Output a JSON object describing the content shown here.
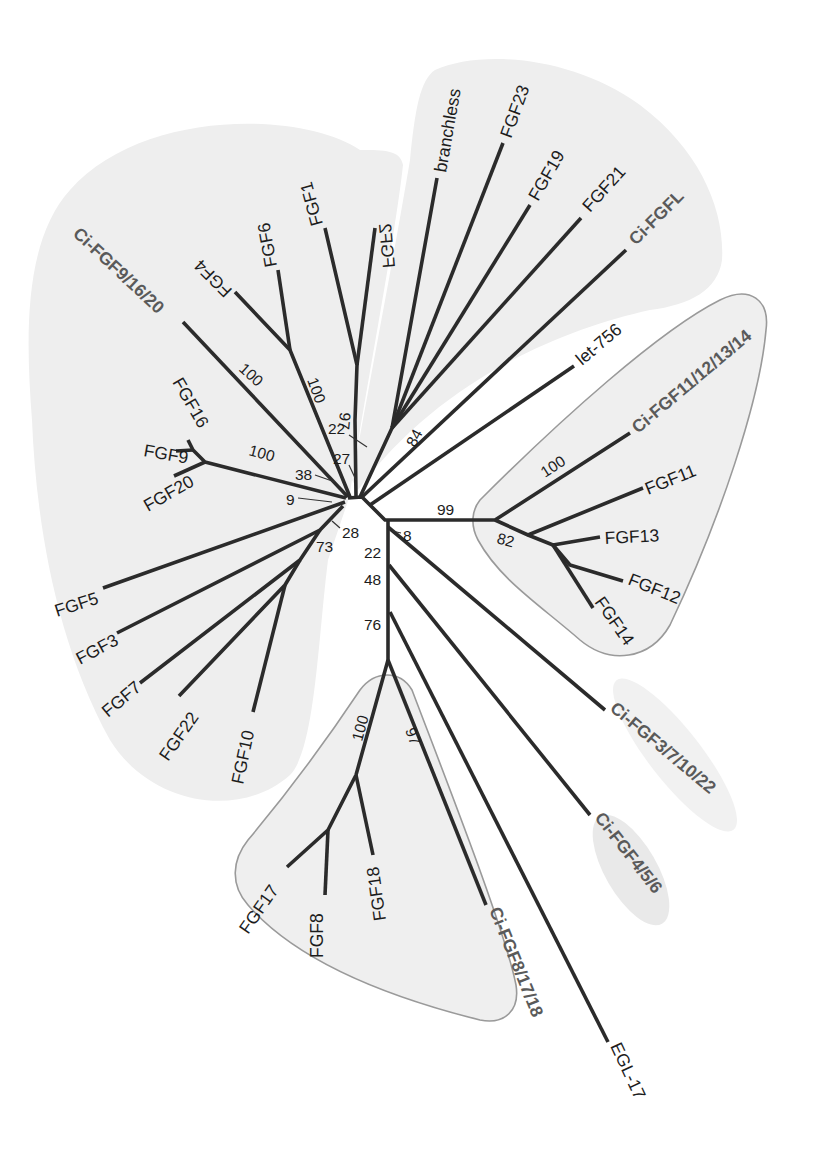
{
  "figure": {
    "type": "unrooted phylogenetic tree"
  },
  "leaves": {
    "fgf1": "FGF1",
    "fgf2": "FGF2",
    "fgf4": "FGF4",
    "fgf6": "FGF6",
    "ci_fgf9_16_20": "Ci-FGF9/16/20",
    "fgf16": "FGF16",
    "fgf9": "FGF9",
    "fgf20": "FGF20",
    "fgf5": "FGF5",
    "fgf3": "FGF3",
    "fgf7": "FGF7",
    "fgf22": "FGF22",
    "fgf10": "FGF10",
    "branchless": "branchless",
    "fgf23": "FGF23",
    "fgf19": "FGF19",
    "fgf21": "FGF21",
    "ci_fgfl": "Ci-FGFL",
    "let756": "let-756",
    "ci_fgf11_12_13_14": "Ci-FGF11/12/13/14",
    "fgf11": "FGF11",
    "fgf13": "FGF13",
    "fgf12": "FGF12",
    "fgf14": "FGF14",
    "ci_fgf3_7_10_22": "Ci-FGF3/7/10/22",
    "ci_fgf4_5_6": "Ci-FGF4/5/6",
    "fgf17": "FGF17",
    "fgf8": "FGF8",
    "fgf18": "FGF18",
    "ci_fgf8_17_18": "Ci-FGF8/17/18",
    "egl17": "EGL-17"
  },
  "bootstrap": {
    "ci_fgf9_branch": "100",
    "fgf4_6": "100",
    "fgf1_2": "97",
    "n22_top": "22",
    "n27": "27",
    "n38": "38",
    "fgf9_16_20": "100",
    "n9": "9",
    "n28": "28",
    "n73": "73",
    "fgf19_group": "84",
    "fgf11_group": "99",
    "n82": "82",
    "ci_fgf11_branch": "100",
    "n8": "8",
    "n22_mid": "22",
    "n48": "48",
    "n76": "76",
    "fgf8_17_18": "100",
    "ci_fgf8_branch": "97"
  },
  "colors": {
    "branch": "#2b2b2b",
    "clade_fill": "#eeeeee",
    "clade_outline": "#9a9a9a",
    "ci_label": "#5a5a5a"
  }
}
